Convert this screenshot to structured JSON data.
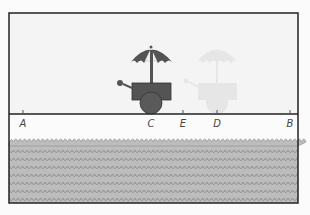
{
  "figure": {
    "points": [
      {
        "label": "A",
        "x": 23
      },
      {
        "label": "C",
        "x": 151
      },
      {
        "label": "E",
        "x": 183
      },
      {
        "label": "D",
        "x": 217
      },
      {
        "label": "B",
        "x": 290
      }
    ],
    "cart": {
      "position_label": "C",
      "color": "#545454",
      "umbrella_color": "#545454"
    },
    "ghost_cart": {
      "position_label": "D",
      "color": "#e6e6e6"
    },
    "colors": {
      "background": "#f4f4f4",
      "frame": "#222222",
      "water": "#b9b9b9",
      "wave_line": "#8e8e8e",
      "cart": "#545454",
      "ghost": "#e4e4e4"
    }
  }
}
